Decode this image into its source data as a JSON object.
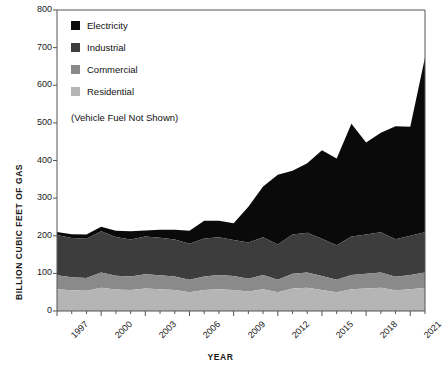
{
  "chart_data": {
    "type": "area",
    "stacked": true,
    "title": "",
    "xlabel": "YEAR",
    "ylabel": "BILLION CUBIC FEET OF GAS",
    "ylim": [
      0,
      800
    ],
    "yticks": [
      0,
      100,
      200,
      300,
      400,
      500,
      600,
      700,
      800
    ],
    "xlim": [
      1997,
      2022
    ],
    "xticks": [
      1997,
      2000,
      2003,
      2006,
      2009,
      2012,
      2015,
      2018,
      2021
    ],
    "grid": false,
    "legend_position": "upper-left-inside",
    "x": [
      1997,
      1998,
      1999,
      2000,
      2001,
      2002,
      2003,
      2004,
      2005,
      2006,
      2007,
      2008,
      2009,
      2010,
      2011,
      2012,
      2013,
      2014,
      2015,
      2016,
      2017,
      2018,
      2019,
      2020,
      2021,
      2022
    ],
    "series": [
      {
        "name": "Residential",
        "color": "#b5b5b5",
        "values": [
          58,
          55,
          54,
          62,
          57,
          56,
          60,
          58,
          56,
          50,
          56,
          58,
          56,
          52,
          58,
          50,
          60,
          62,
          56,
          50,
          58,
          60,
          62,
          55,
          58,
          62
        ]
      },
      {
        "name": "Commercial",
        "color": "#8a8a8a",
        "values": [
          37,
          35,
          34,
          40,
          37,
          36,
          38,
          37,
          36,
          33,
          36,
          38,
          37,
          34,
          38,
          33,
          39,
          40,
          37,
          33,
          38,
          39,
          40,
          36,
          38,
          40
        ]
      },
      {
        "name": "Industrial",
        "color": "#3d3d3d",
        "values": [
          107,
          104,
          104,
          110,
          103,
          98,
          100,
          100,
          98,
          96,
          101,
          100,
          96,
          96,
          100,
          94,
          104,
          106,
          99,
          92,
          102,
          104,
          107,
          100,
          104,
          107
        ]
      },
      {
        "name": "Electricity",
        "color": "#0a0a0a",
        "values": [
          8,
          10,
          11,
          12,
          16,
          22,
          16,
          21,
          26,
          34,
          47,
          44,
          44,
          95,
          135,
          185,
          170,
          185,
          235,
          230,
          300,
          245,
          265,
          300,
          290,
          465
        ]
      }
    ],
    "annotations": [
      "(Vehicle Fuel Not Shown)"
    ]
  },
  "legend": {
    "items": [
      {
        "label": "Electricity",
        "color": "#0a0a0a"
      },
      {
        "label": "Industrial",
        "color": "#3d3d3d"
      },
      {
        "label": "Commercial",
        "color": "#8a8a8a"
      },
      {
        "label": "Residential",
        "color": "#b5b5b5"
      }
    ],
    "note": "(Vehicle Fuel Not Shown)"
  },
  "axes": {
    "y_title": "BILLION CUBIC FEET OF GAS",
    "x_title": "YEAR"
  }
}
